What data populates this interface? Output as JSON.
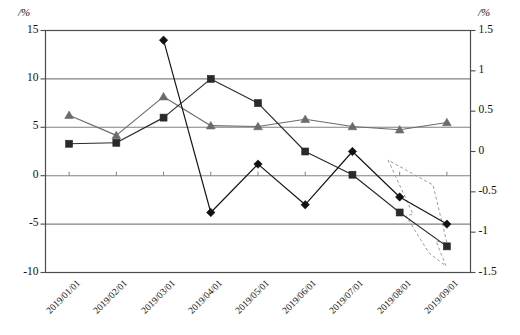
{
  "chart_data": {
    "type": "line",
    "title": "",
    "subtitle": "",
    "xlabel": "",
    "ylabel": "/%",
    "y2label": "/%",
    "grid": true,
    "legend_position": "none",
    "x": [
      "2019/01/01",
      "2019/02/01",
      "2019/03/01",
      "2019/04/01",
      "2019/05/01",
      "2019/06/01",
      "2019/07/01",
      "2019/08/01",
      "2019/09/01"
    ],
    "ylim": [
      -10,
      15
    ],
    "yticks": [
      "15",
      "10",
      "5",
      "0",
      "-5",
      "-10"
    ],
    "ytick_values": [
      15,
      10,
      5,
      0,
      -5,
      -10
    ],
    "y2lim": [
      -1.5,
      1.5
    ],
    "y2ticks": [
      "1.5",
      "1",
      "0.5",
      "0",
      "-0.5",
      "-1",
      "-1.5"
    ],
    "y2tick_values": [
      1.5,
      1,
      0.5,
      0,
      -0.5,
      -1,
      -1.5
    ],
    "series": [
      {
        "name": "diamond-series",
        "marker": "diamond",
        "axis": "left",
        "color": "#111111",
        "values": [
          null,
          null,
          14.0,
          -3.8,
          1.2,
          -3.0,
          2.5,
          -2.2,
          -5.0
        ]
      },
      {
        "name": "square-series",
        "marker": "square",
        "axis": "left",
        "color": "#2a2a2a",
        "values": [
          3.3,
          3.4,
          6.0,
          10.0,
          7.5,
          2.5,
          0.1,
          -3.8,
          -7.3
        ]
      },
      {
        "name": "triangle-series",
        "marker": "triangle",
        "axis": "right",
        "color": "#6b6b6b",
        "values": [
          0.45,
          0.2,
          0.68,
          0.32,
          0.31,
          0.4,
          0.31,
          0.27,
          0.36
        ]
      }
    ],
    "annotations": [
      {
        "name": "trend-arrow",
        "shape": "down-right-arrow-outline",
        "style": "dashed",
        "color": "#9a9a9a",
        "label": ""
      }
    ]
  },
  "colors": {
    "grid": "#808080",
    "frame": "#4d4d4d",
    "diamond": "#111111",
    "square": "#2a2a2a",
    "triangle": "#6b6b6b",
    "annotation": "#9a9a9a",
    "background": "#ffffff"
  }
}
